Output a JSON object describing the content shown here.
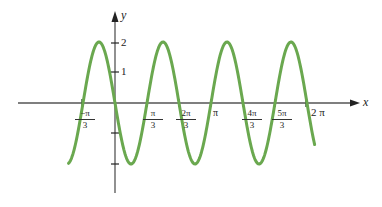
{
  "chart_data": {
    "type": "line",
    "title": "",
    "xlabel": "x",
    "ylabel": "y",
    "function": "y = -2 sin(3x)",
    "series": [
      {
        "name": "y = -2 sin 3x",
        "color": "#6aa84f",
        "x_range": [
          -1.57,
          6.35
        ],
        "points": [
          {
            "x": -1.5708,
            "y": -2
          },
          {
            "x": -1.0472,
            "y": 0
          },
          {
            "x": -0.5236,
            "y": 2
          },
          {
            "x": 0,
            "y": 0
          },
          {
            "x": 0.5236,
            "y": -2
          },
          {
            "x": 1.0472,
            "y": 0
          },
          {
            "x": 1.5708,
            "y": 2
          },
          {
            "x": 2.0944,
            "y": 0
          },
          {
            "x": 2.618,
            "y": -2
          },
          {
            "x": 3.1416,
            "y": 0
          },
          {
            "x": 3.6652,
            "y": 2
          },
          {
            "x": 4.1888,
            "y": 0
          },
          {
            "x": 4.7124,
            "y": -2
          },
          {
            "x": 5.236,
            "y": 0
          },
          {
            "x": 5.7596,
            "y": 2
          },
          {
            "x": 6.2832,
            "y": 0
          }
        ]
      }
    ],
    "x_ticks": [
      {
        "value": -1.0472,
        "num": "−π",
        "den": "3"
      },
      {
        "value": 1.0472,
        "num": "π",
        "den": "3"
      },
      {
        "value": 2.0944,
        "num": "2π",
        "den": "3"
      },
      {
        "value": 3.1416,
        "label": "π"
      },
      {
        "value": 4.1888,
        "num": "4π",
        "den": "3"
      },
      {
        "value": 5.236,
        "num": "5π",
        "den": "3"
      },
      {
        "value": 6.2832,
        "label": "2 π"
      }
    ],
    "y_ticks": [
      {
        "value": 2,
        "label": "2"
      },
      {
        "value": 1,
        "label": "1"
      },
      {
        "value": -1,
        "label": ""
      },
      {
        "value": -2,
        "label": ""
      }
    ],
    "xlim": [
      -3.0,
      7.6
    ],
    "ylim": [
      -3.1,
      3.2
    ],
    "grid": false,
    "legend": null
  },
  "labels": {
    "x_axis": "x",
    "y_axis": "y",
    "tick_neg_pi_3_num": "−π",
    "tick_neg_pi_3_den": "3",
    "tick_pi_3_num": "π",
    "tick_pi_3_den": "3",
    "tick_2pi_3_num": "2π",
    "tick_2pi_3_den": "3",
    "tick_pi": "π",
    "tick_4pi_3_num": "4π",
    "tick_4pi_3_den": "3",
    "tick_5pi_3_num": "5π",
    "tick_5pi_3_den": "3",
    "tick_2pi": "2 π",
    "y_tick_2": "2",
    "y_tick_1": "1"
  }
}
